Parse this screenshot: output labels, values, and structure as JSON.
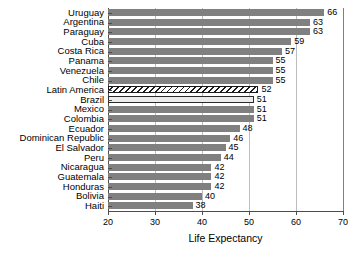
{
  "chart_data": {
    "type": "bar",
    "orientation": "horizontal",
    "title": "",
    "xlabel": "Life Expectancy",
    "ylabel": "",
    "xlim": [
      20,
      70
    ],
    "xticks": [
      20,
      30,
      40,
      50,
      60,
      70
    ],
    "grid": true,
    "legend": false,
    "categories": [
      "Uruguay",
      "Argentina",
      "Paraguay",
      "Cuba",
      "Costa Rica",
      "Panama",
      "Venezuela",
      "Chile",
      "Latin America",
      "Brazil",
      "Mexico",
      "Colombia",
      "Ecuador",
      "Dominican Republic",
      "El Salvador",
      "Peru",
      "Nicaragua",
      "Guatemala",
      "Honduras",
      "Bolivia",
      "Haiti"
    ],
    "values": [
      66,
      63,
      63,
      59,
      57,
      55,
      55,
      55,
      52,
      51,
      51,
      51,
      48,
      46,
      45,
      44,
      42,
      42,
      42,
      40,
      38
    ],
    "value_labels": [
      "66",
      "63",
      "63",
      "59",
      "57",
      "55",
      "55",
      "55",
      "52",
      "51",
      "51",
      "51",
      "48",
      "46",
      "45",
      "44",
      "42",
      "42",
      "42",
      "40",
      "38"
    ],
    "bar_styles": [
      "solid",
      "solid",
      "solid",
      "solid",
      "solid",
      "solid",
      "solid",
      "solid",
      "hatched",
      "light",
      "solid",
      "solid",
      "solid",
      "solid",
      "solid",
      "solid",
      "solid",
      "solid",
      "solid",
      "solid",
      "solid"
    ],
    "colors": {
      "bar_solid": "#808080",
      "bar_light": "#ececec",
      "bar_hatch_line": "#1a1a1a",
      "axis": "#4d4d4d",
      "gridline": "#bdbdbd",
      "text": "#000000",
      "background": "#ffffff"
    }
  }
}
